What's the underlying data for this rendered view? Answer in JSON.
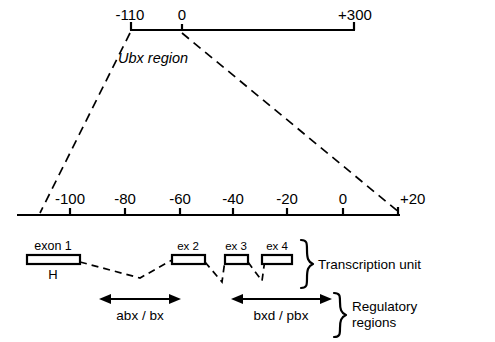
{
  "figure": {
    "background_color": "#ffffff",
    "ink_color": "#000000"
  },
  "top_axis": {
    "name": "ubx-region-overview-scale",
    "ticks": [
      {
        "label": "-110",
        "value": -110,
        "x": 130
      },
      {
        "label": "0",
        "value": 0,
        "x": 182
      },
      {
        "label": "+300",
        "value": 300,
        "x": 355
      }
    ],
    "line": {
      "x1": 130,
      "x2": 355,
      "y": 30
    },
    "region_label": "Ubx region"
  },
  "middle_axis": {
    "name": "expanded-scale",
    "line": {
      "x1": 17,
      "x2": 400,
      "y": 215
    },
    "ticks": [
      {
        "label": "-100",
        "value": -100,
        "x": 70
      },
      {
        "label": "-80",
        "value": -80,
        "x": 125
      },
      {
        "label": "-60",
        "value": -60,
        "x": 180
      },
      {
        "label": "-40",
        "value": -40,
        "x": 233
      },
      {
        "label": "-20",
        "value": -20,
        "x": 287
      },
      {
        "label": "0",
        "value": 0,
        "x": 343
      },
      {
        "label": "+20",
        "value": 20,
        "x": 397
      }
    ]
  },
  "funnel": {
    "left": {
      "x1": 130,
      "y1": 32,
      "x2": 40,
      "y2": 213
    },
    "right": {
      "x1": 182,
      "y1": 32,
      "x2": 400,
      "y2": 213
    }
  },
  "exons": [
    {
      "label": "exon 1",
      "x": 27,
      "width": 53,
      "sublabel": "H"
    },
    {
      "label": "ex 2",
      "x": 172,
      "width": 33,
      "sublabel": ""
    },
    {
      "label": "ex 3",
      "x": 225,
      "width": 23,
      "sublabel": ""
    },
    {
      "label": "ex 4",
      "x": 262,
      "width": 30,
      "sublabel": ""
    }
  ],
  "exon_track": {
    "y": 255,
    "height": 9
  },
  "brackets": [
    {
      "label": "Transcription unit",
      "x": 300,
      "y_top": 240,
      "y_bottom": 290
    },
    {
      "label": "Regulatory regions",
      "label_line_2": "regions",
      "x": 332,
      "y_top": 292,
      "y_bottom": 336
    }
  ],
  "arrows": [
    {
      "label": "abx / bx",
      "x1": 100,
      "x2": 180,
      "y": 299,
      "double_headed": true
    },
    {
      "label": "bxd / pbx",
      "x1": 232,
      "x2": 330,
      "y": 299,
      "double_headed": true
    }
  ],
  "labels": {
    "transcription_unit": "Transcription unit",
    "regulatory_regions_line1": "Regulatory",
    "regulatory_regions_line2": "regions",
    "abx_bx": "abx / bx",
    "bxd_pbx": "bxd / pbx",
    "h_site": "H"
  }
}
